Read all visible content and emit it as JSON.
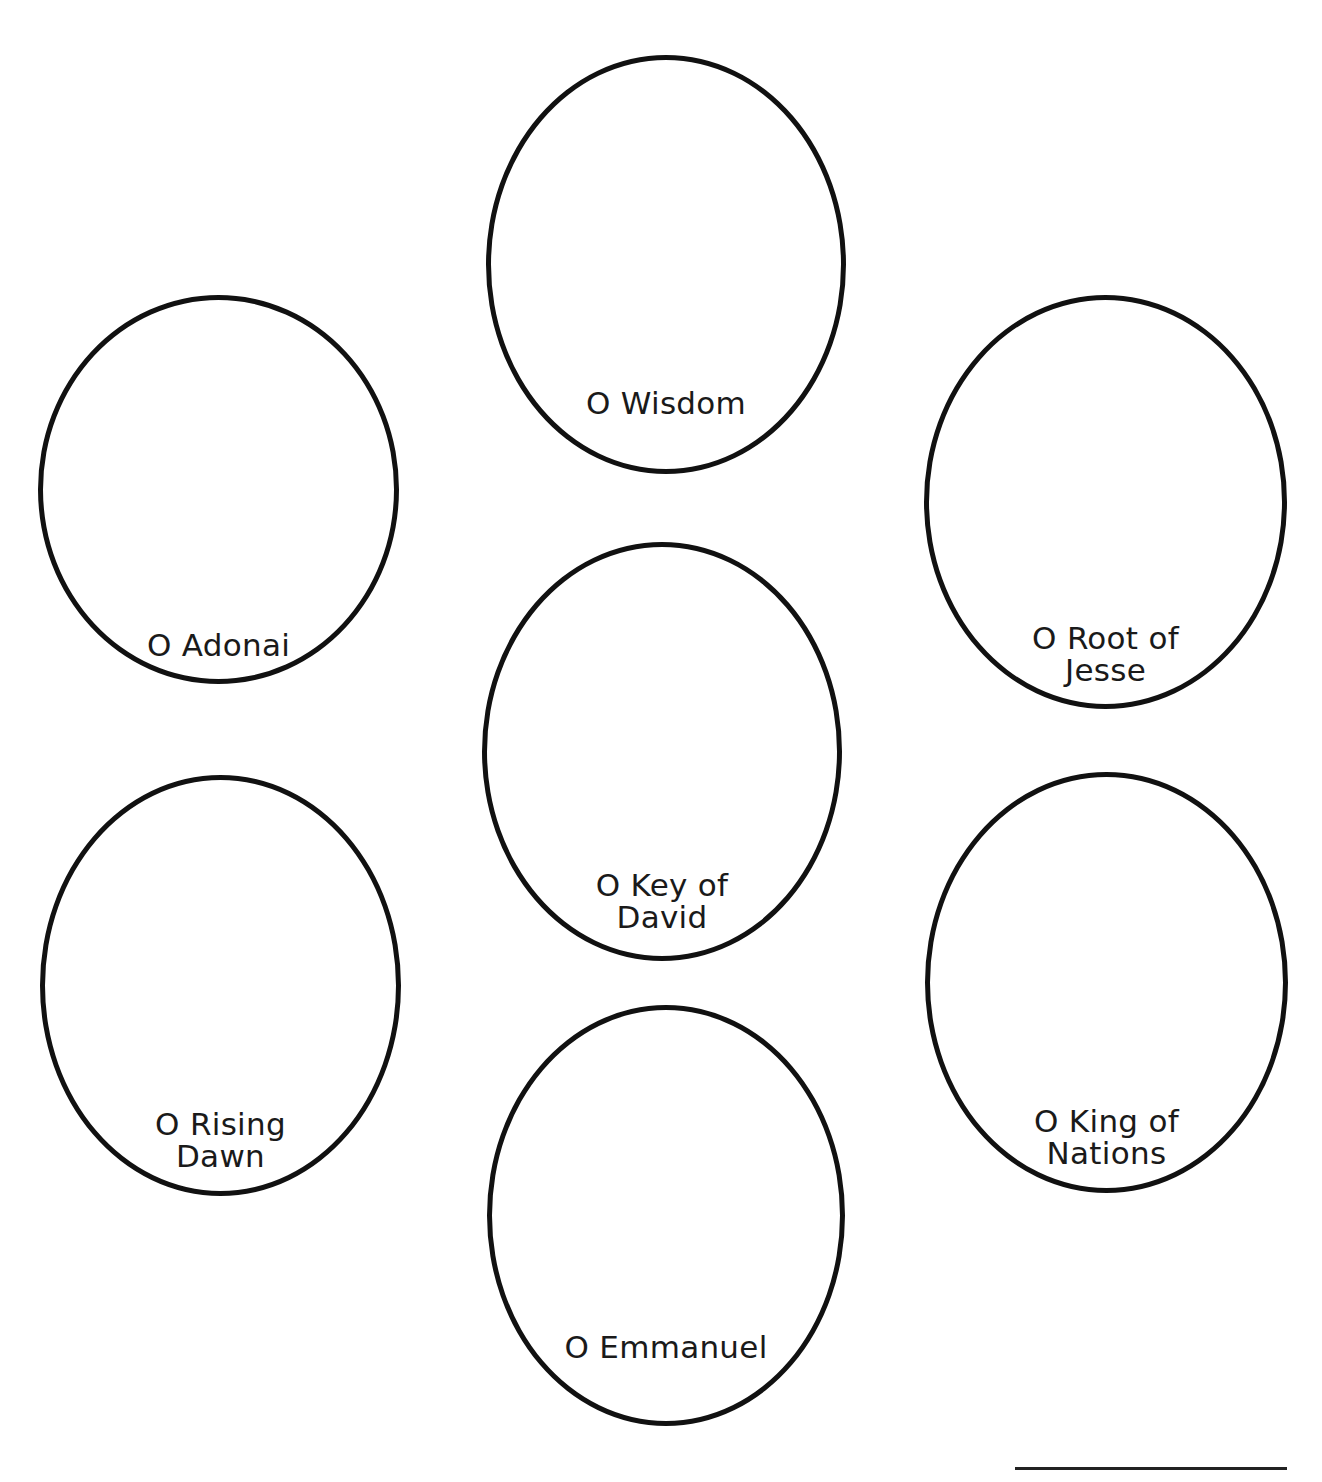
{
  "diagram": {
    "type": "ovals-layout",
    "stroke_color": "#111111",
    "text_color": "#1a1a1a",
    "ovals": [
      {
        "id": "wisdom",
        "lines": [
          "O Wisdom"
        ],
        "box": {
          "left": 486,
          "top": 55,
          "width": 360,
          "height": 419
        },
        "label_top": 327
      },
      {
        "id": "adonai",
        "lines": [
          "O Adonai"
        ],
        "box": {
          "left": 38,
          "top": 295,
          "width": 361,
          "height": 389
        },
        "label_top": 329
      },
      {
        "id": "root-of-jesse",
        "lines": [
          "O Root of",
          "Jesse"
        ],
        "box": {
          "left": 924,
          "top": 295,
          "width": 363,
          "height": 414
        },
        "label_top": 322
      },
      {
        "id": "key-of-david",
        "lines": [
          "O Key of",
          "David"
        ],
        "box": {
          "left": 482,
          "top": 542,
          "width": 360,
          "height": 419
        },
        "label_top": 322
      },
      {
        "id": "rising-dawn",
        "lines": [
          "O Rising",
          "Dawn"
        ],
        "box": {
          "left": 40,
          "top": 775,
          "width": 361,
          "height": 421
        },
        "label_top": 328
      },
      {
        "id": "king-of-nations",
        "lines": [
          "O King of",
          "Nations"
        ],
        "box": {
          "left": 925,
          "top": 772,
          "width": 363,
          "height": 421
        },
        "label_top": 328
      },
      {
        "id": "emmanuel",
        "lines": [
          "O Emmanuel"
        ],
        "box": {
          "left": 487,
          "top": 1005,
          "width": 358,
          "height": 421
        },
        "label_top": 321
      }
    ],
    "answer_line": {
      "visible": true
    }
  }
}
